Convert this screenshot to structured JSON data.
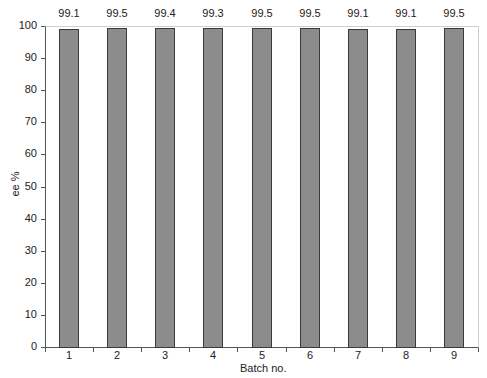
{
  "chart_data": {
    "type": "bar",
    "title": "",
    "xlabel": "Batch no.",
    "ylabel": "ee %",
    "categories": [
      "1",
      "2",
      "3",
      "4",
      "5",
      "6",
      "7",
      "8",
      "9"
    ],
    "values": [
      99.1,
      99.5,
      99.4,
      99.3,
      99.5,
      99.5,
      99.1,
      99.1,
      99.5
    ],
    "data_labels": [
      "99.1",
      "99.5",
      "99.4",
      "99.3",
      "99.5",
      "99.5",
      "99.1",
      "99.1",
      "99.5"
    ],
    "ylim": [
      0,
      100
    ],
    "yticks": [
      0,
      10,
      20,
      30,
      40,
      50,
      60,
      70,
      80,
      90,
      100
    ],
    "grid": false,
    "legend": null,
    "colors": {
      "bar_fill": "#8c8c8c",
      "bar_edge": "#3a3a3a",
      "axis": "#555555"
    }
  }
}
